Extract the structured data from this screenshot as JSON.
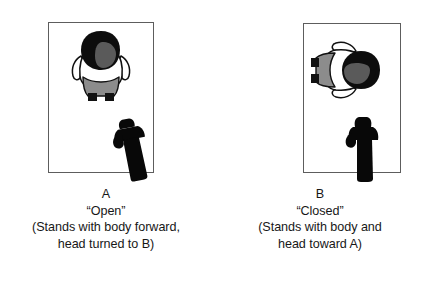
{
  "figure": {
    "background_color": "#ffffff",
    "panels": [
      {
        "id": "A",
        "label": "A",
        "condition": "“Open”",
        "description_line_1": "(Stands with body forward,",
        "description_line_2": "head turned to B)",
        "frame_color": "#5d5d5d",
        "person": {
          "name": "top-down-person-a",
          "orientation": "facing-viewer-head-turned-right",
          "hair_color": "#0d0d0d",
          "face_color": "#5a5a5a",
          "shirt_color": "#ffffff",
          "pants_color": "#8c8c8c",
          "shoes_color": "#111111",
          "outline_color": "#111111"
        },
        "observer": {
          "name": "silhouette-observer-a",
          "fill_color": "#080808",
          "rotation_deg": -12
        }
      },
      {
        "id": "B",
        "label": "B",
        "condition": "“Closed”",
        "description_line_1": "(Stands with body and",
        "description_line_2": "head toward A)",
        "frame_color": "#5d5d5d",
        "person": {
          "name": "top-down-person-b",
          "orientation": "rotated-facing-right-toward-a",
          "hair_color": "#0d0d0d",
          "face_color": "#5a5a5a",
          "shirt_color": "#ffffff",
          "pants_color": "#8c8c8c",
          "shoes_color": "#111111",
          "outline_color": "#111111"
        },
        "observer": {
          "name": "silhouette-observer-b",
          "fill_color": "#080808",
          "rotation_deg": 0
        }
      }
    ]
  }
}
